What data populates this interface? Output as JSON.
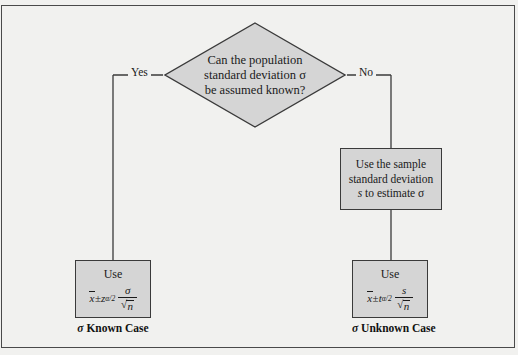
{
  "figure": {
    "background_color": "#f1f1ef",
    "shape_fill_color": "#d5d5d5",
    "shape_border_color": "#3a3a3a",
    "frame_color": "#4a4a4a"
  },
  "decision": {
    "line1": "Can the population",
    "line2": "standard deviation σ",
    "line3": "be assumed known?"
  },
  "branches": {
    "yes_label": "Yes",
    "no_label": "No"
  },
  "sample_box": {
    "line1": "Use the sample",
    "line2": "standard deviation",
    "line3_pre": "s",
    "line3_post": " to estimate σ"
  },
  "known_case": {
    "use_label": "Use",
    "formula": {
      "mean": "x",
      "plus_minus": "±",
      "stat": "z",
      "subscript": "α/2",
      "numerator": "σ",
      "denominator": "n"
    },
    "caption_symbol": "σ",
    "caption_text": "Known Case"
  },
  "unknown_case": {
    "use_label": "Use",
    "formula": {
      "mean": "x",
      "plus_minus": "±",
      "stat": "t",
      "subscript": "α/2",
      "numerator": "s",
      "denominator": "n"
    },
    "caption_symbol": "σ",
    "caption_text": "Unknown Case"
  }
}
